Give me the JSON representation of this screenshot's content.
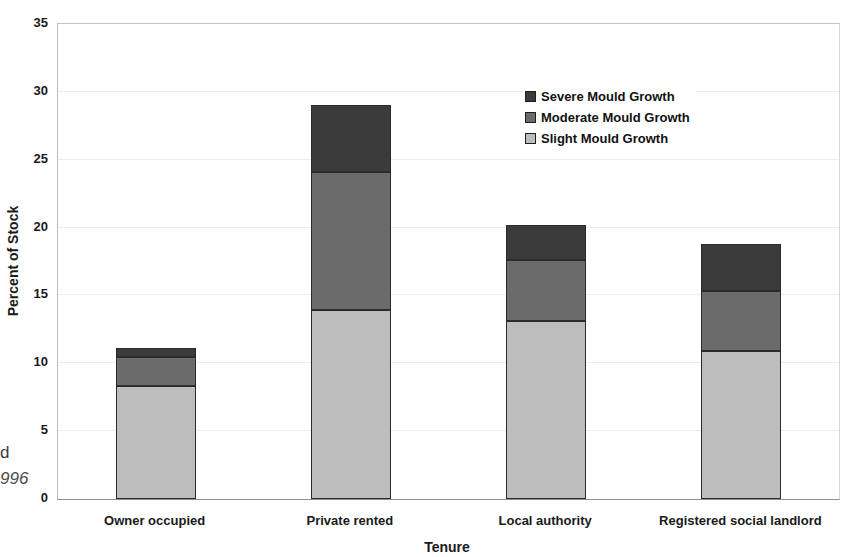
{
  "page": {
    "fragments": [
      {
        "text": "d",
        "italic": false
      },
      {
        "text": "996",
        "italic": true
      }
    ]
  },
  "chart_data": {
    "type": "bar",
    "stacked": true,
    "title": "",
    "xlabel": "Tenure",
    "ylabel": "Percent of Stock",
    "ylim": [
      0,
      35
    ],
    "yticks": [
      0,
      5,
      10,
      15,
      20,
      25,
      30,
      35
    ],
    "grid": "faint horizontal gridlines every 5",
    "legend_position": "upper right inside plot, no border",
    "categories": [
      "Owner occupied",
      "Private rented",
      "Local authority",
      "Registered social landlord"
    ],
    "series": [
      {
        "name": "Slight Mould Growth",
        "color": "#bdbdbd",
        "values": [
          8.3,
          13.9,
          13.1,
          10.9
        ]
      },
      {
        "name": "Moderate Mould Growth",
        "color": "#6b6b6b",
        "values": [
          2.2,
          10.2,
          4.5,
          4.4
        ]
      },
      {
        "name": "Severe Mould Growth",
        "color": "#3b3b3b",
        "values": [
          0.6,
          4.9,
          2.6,
          3.5
        ]
      }
    ],
    "legend_order": [
      "Severe Mould Growth",
      "Moderate Mould Growth",
      "Slight Mould Growth"
    ],
    "totals": [
      11.1,
      29.0,
      20.2,
      18.8
    ],
    "bar_width_px": 80
  }
}
